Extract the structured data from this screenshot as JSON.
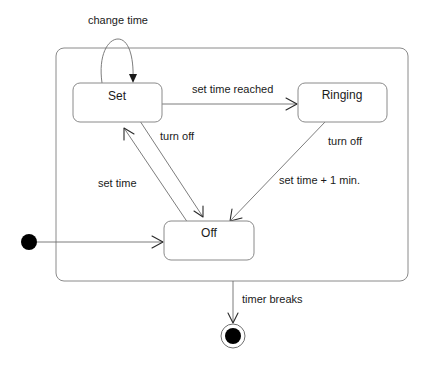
{
  "diagram": {
    "type": "UML state machine",
    "composite_state": {
      "x": 56,
      "y": 48,
      "width": 352,
      "height": 233
    },
    "states": [
      {
        "id": "set",
        "name": "Set",
        "x": 73,
        "y": 83,
        "width": 89,
        "height": 39
      },
      {
        "id": "ringing",
        "name": "Ringing",
        "x": 298,
        "y": 83,
        "width": 89,
        "height": 39
      },
      {
        "id": "off",
        "name": "Off",
        "x": 164,
        "y": 221,
        "width": 90,
        "height": 39
      }
    ],
    "initial_state": {
      "cx": 29,
      "cy": 242,
      "r": 8
    },
    "final_state": {
      "cx": 233,
      "cy": 336,
      "r_outer": 12,
      "r_inner": 8
    },
    "transitions": [
      {
        "id": "t-change-time",
        "from": "Set",
        "to": "Set",
        "label": "change time"
      },
      {
        "id": "t-set-time-reached",
        "from": "Set",
        "to": "Ringing",
        "label": "set time reached"
      },
      {
        "id": "t-set-turn-off",
        "from": "Set",
        "to": "Off",
        "label": "turn off"
      },
      {
        "id": "t-set-time",
        "from": "Off",
        "to": "Set",
        "label": "set time"
      },
      {
        "id": "t-ringing-off",
        "from": "Ringing",
        "to": "Off",
        "label_line1": "turn off",
        "label_line2": "set time + 1 min."
      },
      {
        "id": "t-initial",
        "from": "initial",
        "to": "Off",
        "label": ""
      },
      {
        "id": "t-timer-breaks",
        "from": "composite",
        "to": "final",
        "label": "timer breaks"
      }
    ],
    "colors": {
      "line": "#6e6e6e",
      "border": "#8a8a8a",
      "text": "#1a1a1a",
      "fill_node": "#000000"
    }
  }
}
